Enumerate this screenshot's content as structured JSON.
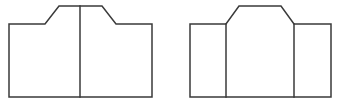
{
  "diagram": {
    "stroke_color": "#3a3a3a",
    "background": "#ffffff",
    "figures": [
      {
        "id": "left-figure",
        "description": "Stepped outline with one central vertical divider (two panels)",
        "outline_points": [
          [
            9,
            97
          ],
          [
            9,
            24
          ],
          [
            45,
            24
          ],
          [
            59,
            6
          ],
          [
            102,
            6
          ],
          [
            116,
            24
          ],
          [
            152,
            24
          ],
          [
            152,
            97
          ]
        ],
        "dividers": [
          {
            "x": 80,
            "y1": 6,
            "y2": 97
          }
        ]
      },
      {
        "id": "right-figure",
        "description": "Stepped outline with two vertical dividers (three panels, raised center)",
        "outline_points": [
          [
            190,
            97
          ],
          [
            190,
            24
          ],
          [
            226,
            24
          ],
          [
            239,
            6
          ],
          [
            281,
            6
          ],
          [
            294,
            24
          ],
          [
            331,
            24
          ],
          [
            331,
            97
          ]
        ],
        "dividers": [
          {
            "x": 226,
            "y1": 24,
            "y2": 97
          },
          {
            "x": 294,
            "y1": 24,
            "y2": 97
          }
        ]
      }
    ]
  }
}
